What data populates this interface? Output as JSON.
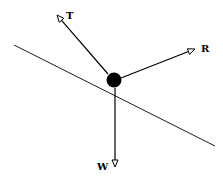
{
  "diagram": {
    "type": "free-body-diagram",
    "colors": {
      "line": "#000000",
      "background": "#ffffff",
      "mass": "#000000"
    },
    "incline": {
      "x1": 14,
      "y1": 45,
      "x2": 215,
      "y2": 146
    },
    "mass": {
      "cx": 114,
      "cy": 80,
      "r": 7.5
    },
    "forces": [
      {
        "id": "tension",
        "label": "T",
        "x1": 108,
        "y1": 74,
        "x2": 57,
        "y2": 15,
        "label_x": 66,
        "label_y": 19
      },
      {
        "id": "reaction",
        "label": "R",
        "x1": 121,
        "y1": 78,
        "x2": 195,
        "y2": 49,
        "label_x": 201,
        "label_y": 52
      },
      {
        "id": "weight",
        "label": "W",
        "x1": 115,
        "y1": 88,
        "x2": 115,
        "y2": 167,
        "label_x": 97,
        "label_y": 170
      }
    ]
  }
}
